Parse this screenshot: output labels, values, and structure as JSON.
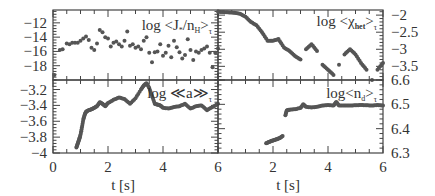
{
  "figure": {
    "xlabel_left": "t [s]",
    "xlabel_right": "t [s]",
    "colors": {
      "axis": "#444444",
      "marker": "#555555",
      "text": "#333333"
    }
  },
  "chart_data": [
    {
      "id": "top-left",
      "type": "scatter",
      "label": "log <J*/nH>τ",
      "xlim": [
        0,
        6
      ],
      "ylim": [
        -20,
        -10.2
      ],
      "yticks": [
        -12,
        -14,
        -16,
        -18
      ],
      "ytick_labels": [
        "-12",
        "-14",
        "-16",
        "-18"
      ],
      "xticks": [
        0,
        2,
        4,
        6
      ],
      "y_axis_side": "left",
      "x": [
        0.05,
        0.25,
        0.35,
        0.5,
        0.6,
        0.7,
        0.8,
        0.9,
        1.0,
        1.1,
        1.2,
        1.3,
        1.4,
        1.5,
        1.6,
        1.7,
        1.8,
        1.9,
        2.0,
        2.1,
        2.2,
        2.3,
        2.4,
        2.5,
        2.6,
        2.7,
        2.8,
        2.9,
        3.0,
        3.1,
        3.2,
        3.3,
        3.4,
        3.5,
        3.6,
        3.7,
        3.8,
        3.9,
        4.0,
        4.1,
        4.2,
        4.3,
        4.4,
        4.5,
        4.6,
        4.7,
        4.8,
        4.9,
        5.0,
        5.1,
        5.2,
        5.3,
        5.4,
        5.5,
        5.6,
        5.7,
        5.8,
        5.9,
        6.0
      ],
      "y": [
        -19.3,
        -15.8,
        -15.7,
        -14.9,
        -15.0,
        -14.8,
        -14.8,
        -14.8,
        -14.5,
        -14.2,
        -13.9,
        -14.4,
        -15.5,
        -15.8,
        -14.9,
        -13.0,
        -13.3,
        -14.0,
        -14.2,
        -15.3,
        -14.8,
        -14.6,
        -15.0,
        -15.3,
        -14.5,
        -13.2,
        -15.2,
        -15.0,
        -15.5,
        -15.3,
        -15.7,
        -14.5,
        -14.0,
        -16.2,
        -17.5,
        -16.1,
        -16.0,
        -15.0,
        -16.6,
        -16.2,
        -15.2,
        -16.8,
        -14.5,
        -15.4,
        -16.1,
        -17.0,
        -16.5,
        -14.3,
        -15.8,
        -17.2,
        -16.0,
        -16.2,
        -15.8,
        -15.6,
        -15.3,
        -16.2,
        -18.2,
        -16.2,
        -15.6
      ]
    },
    {
      "id": "top-right",
      "type": "scatter",
      "label": "log <χhet>τ",
      "xlim": [
        0,
        6
      ],
      "ylim": [
        -3.9,
        -1.85
      ],
      "yticks": [
        -2,
        -2.5,
        -3,
        -3.5
      ],
      "ytick_labels": [
        "-2",
        "-2.5",
        "-3",
        "-3.5"
      ],
      "xticks": [
        0,
        2,
        4,
        6
      ],
      "y_axis_side": "right",
      "x": [
        0.0,
        0.2,
        0.4,
        0.6,
        0.8,
        1.0,
        1.2,
        1.4,
        1.6,
        1.8,
        2.0,
        2.2,
        2.4,
        2.6,
        2.8,
        3.0,
        3.2,
        3.4,
        3.6,
        3.8,
        4.0,
        4.2,
        4.4,
        4.6,
        4.8,
        5.0,
        5.2,
        5.4,
        5.6,
        5.8,
        6.0
      ],
      "y": [
        -1.9,
        -1.91,
        -1.92,
        -1.93,
        -1.96,
        -2.05,
        -2.2,
        -2.3,
        -2.5,
        -2.75,
        -2.75,
        -2.7,
        -2.95,
        -3.05,
        -3.2,
        -3.3,
        -3.0,
        -2.85,
        -3.05,
        -3.45,
        -3.6,
        -3.75,
        -3.45,
        -3.15,
        -3.0,
        -3.15,
        -3.4,
        -3.6,
        -3.9,
        -3.6,
        -3.4
      ]
    },
    {
      "id": "bottom-left",
      "type": "scatter",
      "label": "log ≪a≫τ",
      "xlim": [
        0,
        6
      ],
      "ylim": [
        -4,
        -3.08
      ],
      "yticks": [
        -3.2,
        -3.4,
        -3.6,
        -3.8,
        -4
      ],
      "ytick_labels": [
        "-3.2",
        "-3.4",
        "-3.6",
        "-3.8",
        "-4"
      ],
      "xticks": [
        0,
        2,
        4,
        6
      ],
      "xtick_labels": [
        "0",
        "2",
        "4",
        "6"
      ],
      "y_axis_side": "left",
      "x": [
        0.85,
        0.9,
        0.95,
        1.0,
        1.05,
        1.1,
        1.15,
        1.2,
        1.3,
        1.4,
        1.5,
        1.6,
        1.7,
        1.8,
        1.9,
        2.0,
        2.2,
        2.4,
        2.6,
        2.8,
        3.0,
        3.2,
        3.3,
        3.4,
        3.5,
        3.6,
        3.7,
        3.8,
        3.9,
        4.0,
        4.2,
        4.4,
        4.6,
        4.8,
        5.0,
        5.2,
        5.4,
        5.6,
        5.8,
        6.0
      ],
      "y": [
        -3.93,
        -3.88,
        -3.83,
        -3.77,
        -3.68,
        -3.58,
        -3.52,
        -3.48,
        -3.46,
        -3.45,
        -3.43,
        -3.41,
        -3.36,
        -3.38,
        -3.41,
        -3.37,
        -3.33,
        -3.3,
        -3.32,
        -3.38,
        -3.31,
        -3.2,
        -3.15,
        -3.12,
        -3.18,
        -3.28,
        -3.38,
        -3.39,
        -3.4,
        -3.43,
        -3.44,
        -3.42,
        -3.41,
        -3.38,
        -3.44,
        -3.41,
        -3.4,
        -3.46,
        -3.42,
        -3.38
      ]
    },
    {
      "id": "bottom-right",
      "type": "scatter",
      "label": "log <nd>τ",
      "xlim": [
        0,
        6
      ],
      "ylim": [
        6.3,
        6.6
      ],
      "yticks": [
        6.6,
        6.5,
        6.4,
        6.3
      ],
      "ytick_labels": [
        "6.6",
        "6.5",
        "6.4",
        "6.3"
      ],
      "xticks": [
        0,
        2,
        4,
        6
      ],
      "xtick_labels": [
        "2",
        "4",
        "6"
      ],
      "y_axis_side": "right",
      "x": [
        1.75,
        1.85,
        1.95,
        2.05,
        2.15,
        2.25,
        2.35,
        2.45,
        2.5,
        2.6,
        2.8,
        3.0,
        3.1,
        3.2,
        3.4,
        3.6,
        3.8,
        4.0,
        4.2,
        4.3,
        4.4,
        4.6,
        4.8,
        5.0,
        5.2,
        5.4,
        5.6,
        5.8,
        6.0
      ],
      "y": [
        6.34,
        6.345,
        6.35,
        6.353,
        6.357,
        6.362,
        6.37,
        6.455,
        6.475,
        6.478,
        6.48,
        6.485,
        6.5,
        6.49,
        6.487,
        6.49,
        6.495,
        6.497,
        6.495,
        6.51,
        6.495,
        6.495,
        6.495,
        6.496,
        6.497,
        6.496,
        6.495,
        6.497,
        6.495
      ]
    }
  ]
}
